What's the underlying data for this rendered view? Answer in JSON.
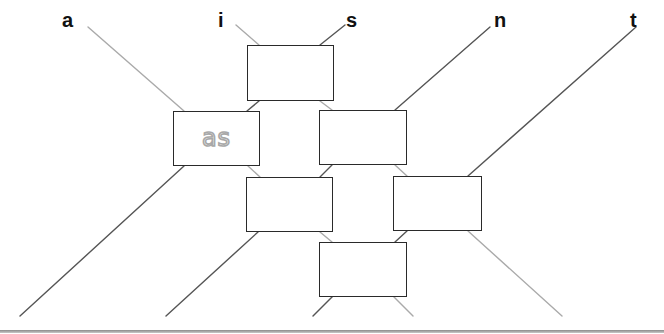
{
  "diagram": {
    "type": "comparator network",
    "inputs": [
      {
        "label": "a",
        "x": 62,
        "y": 10
      },
      {
        "label": "i",
        "x": 218,
        "y": 10
      },
      {
        "label": "s",
        "x": 346,
        "y": 10
      },
      {
        "label": "n",
        "x": 494,
        "y": 10
      },
      {
        "label": "t",
        "x": 630,
        "y": 10
      }
    ],
    "boxes": [
      {
        "id": "box-1",
        "x": 247,
        "y": 45,
        "w": 87,
        "h": 56,
        "text": ""
      },
      {
        "id": "box-2",
        "x": 173,
        "y": 111,
        "w": 87,
        "h": 55,
        "text": "as"
      },
      {
        "id": "box-3",
        "x": 319,
        "y": 110,
        "w": 88,
        "h": 55,
        "text": ""
      },
      {
        "id": "box-4",
        "x": 246,
        "y": 177,
        "w": 87,
        "h": 55,
        "text": ""
      },
      {
        "id": "box-5",
        "x": 393,
        "y": 176,
        "w": 89,
        "h": 55,
        "text": ""
      },
      {
        "id": "box-6",
        "x": 319,
        "y": 242,
        "w": 88,
        "h": 55,
        "text": ""
      }
    ],
    "colors": {
      "descending_wire": "#aaaaaa",
      "ascending_wire": "#555555",
      "box_border": "#2a2a2a",
      "label": "#111111",
      "box_text": "#a8a8a8"
    }
  }
}
